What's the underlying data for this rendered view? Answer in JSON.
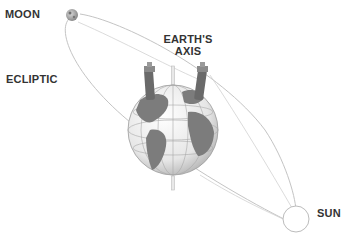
{
  "labels": {
    "moon": "MOON",
    "ecliptic": "ECLIPTIC",
    "axis_line1": "EARTH'S",
    "axis_line2": "AXIS",
    "sun": "SUN"
  },
  "colors": {
    "orbit_line": "#bdbdbd",
    "globe_land": "#7a7a7a",
    "globe_ocean": "#f2f2f2",
    "label_text": "#333333"
  }
}
